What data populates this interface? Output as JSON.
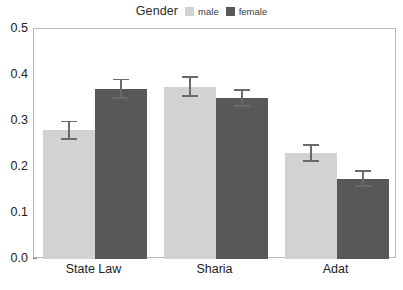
{
  "chart_data": {
    "type": "bar",
    "title": "",
    "xlabel": "",
    "ylabel": "",
    "ylim": [
      0,
      0.5
    ],
    "yticks": [
      0.0,
      0.1,
      0.2,
      0.3,
      0.4,
      0.5
    ],
    "ytick_labels": [
      "0.0",
      "0.1",
      "0.2",
      "0.3",
      "0.4",
      "0.5"
    ],
    "grid": false,
    "categories": [
      "State Law",
      "Sharia",
      "Adat"
    ],
    "legend": {
      "title": "Gender",
      "position": "top-center",
      "orientation": "horizontal",
      "entries": [
        {
          "label": "male",
          "color": "#d2d2d2"
        },
        {
          "label": "female",
          "color": "#585858"
        }
      ]
    },
    "series": [
      {
        "name": "male",
        "color": "#d2d2d2",
        "values": [
          0.28,
          0.375,
          0.23
        ],
        "errors": [
          0.021,
          0.022,
          0.019
        ]
      },
      {
        "name": "female",
        "color": "#585858",
        "values": [
          0.37,
          0.35,
          0.175
        ],
        "errors": [
          0.022,
          0.019,
          0.018
        ]
      }
    ],
    "error_bar_style": "capped",
    "panel_border_color": "#b9b9b9",
    "background_color": "#ffffff"
  }
}
